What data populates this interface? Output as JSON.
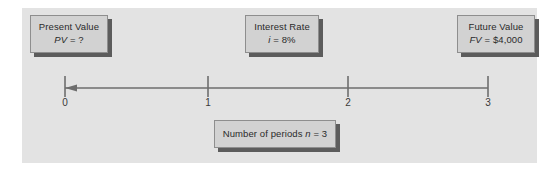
{
  "diagram": {
    "title_text": "",
    "background_color": "#e3e3e3",
    "box_fill_color": "#d2d2d2",
    "box_border_color": "#8e8e8e",
    "box_shadow_color": "#5c5c5c",
    "line_color": "#6e6e6e"
  },
  "boxes": {
    "present_value": {
      "label": "Present Value",
      "symbol": "PV",
      "equals": " = ",
      "value": "?"
    },
    "interest_rate": {
      "label": "Interest Rate",
      "symbol": "i",
      "equals": " = ",
      "value": "8%"
    },
    "future_value": {
      "label": "Future Value",
      "symbol": "FV",
      "equals": " = ",
      "value": "$4,000"
    },
    "number_of_periods": {
      "label": "Number of periods ",
      "symbol": "n",
      "equals": " = ",
      "value": "3"
    }
  },
  "timeline": {
    "arrow_direction": "left",
    "ticks": [
      {
        "label": "0",
        "x": 65
      },
      {
        "label": "1",
        "x": 208
      },
      {
        "label": "2",
        "x": 348
      },
      {
        "label": "3",
        "x": 488
      }
    ],
    "axis_y": 88,
    "tick_top": 76,
    "tick_bottom": 96
  }
}
